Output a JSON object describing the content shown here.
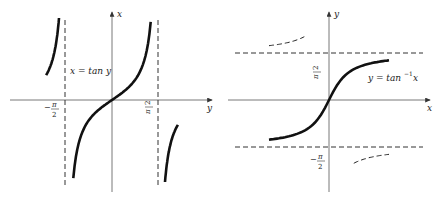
{
  "chart_data": [
    {
      "type": "line",
      "title": "",
      "xlabel": "y",
      "ylabel": "x",
      "curve_label": "x = tan y",
      "function": "x = tan(y)",
      "x_range": [
        -2.4,
        2.4
      ],
      "y_range": [
        -4,
        4
      ],
      "tick_labels": [
        "−π/2",
        "π/2"
      ],
      "asymptotes": [
        {
          "axis": "vertical",
          "value": -1.5708,
          "style": "dashed"
        },
        {
          "axis": "vertical",
          "value": 1.5708,
          "style": "dashed"
        }
      ],
      "series": [
        {
          "name": "left-branch",
          "x": [
            -2.2,
            -2.0,
            -1.85,
            -1.7,
            -1.63
          ],
          "y": [
            1.37,
            2.19,
            3.42,
            7.7,
            16.0
          ]
        },
        {
          "name": "main-branch",
          "x": [
            -1.35,
            -1.0,
            -0.5,
            0,
            0.5,
            1.0,
            1.35
          ],
          "y": [
            -4.46,
            -1.56,
            -0.55,
            0,
            0.55,
            1.56,
            4.46
          ]
        },
        {
          "name": "right-branch",
          "x": [
            1.63,
            1.7,
            1.85,
            2.0,
            2.2
          ],
          "y": [
            -16.0,
            -7.7,
            -3.42,
            -2.19,
            -1.37
          ]
        }
      ]
    },
    {
      "type": "line",
      "title": "",
      "xlabel": "x",
      "ylabel": "y",
      "curve_label_main": "y = tan",
      "curve_label_sup": "−1",
      "curve_label_var": "x",
      "function": "y = arctan(x)",
      "x_range": [
        -6,
        6
      ],
      "y_range": [
        -2.4,
        2.4
      ],
      "tick_labels": [
        "π/2",
        "−π/2"
      ],
      "asymptotes": [
        {
          "axis": "horizontal",
          "value": 1.5708,
          "style": "dashed"
        },
        {
          "axis": "horizontal",
          "value": -1.5708,
          "style": "dashed"
        }
      ],
      "series": [
        {
          "name": "arctan",
          "style": "solid",
          "x": [
            -4,
            -2,
            -1,
            0,
            1,
            2,
            4
          ],
          "y": [
            -1.33,
            -1.11,
            -0.79,
            0,
            0.79,
            1.11,
            1.33
          ]
        },
        {
          "name": "upper-reflected-branch",
          "style": "dashed"
        },
        {
          "name": "lower-reflected-branch",
          "style": "dashed"
        }
      ]
    }
  ]
}
